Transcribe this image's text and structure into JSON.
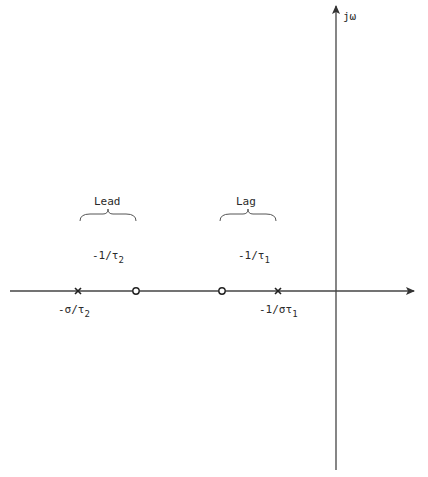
{
  "diagram": {
    "type": "s-plane pole-zero plot",
    "axes": {
      "imag_label": "jω",
      "real_axis": {
        "x1": 10,
        "x2": 415,
        "y": 291
      },
      "imag_axis": {
        "x": 336,
        "y1": 5,
        "y2": 470
      }
    },
    "groups": [
      {
        "label": "Lead",
        "brace_x1": 80,
        "brace_x2": 136,
        "zero_label_main": "-1/τ",
        "zero_label_sub": "2"
      },
      {
        "label": "Lag",
        "brace_x1": 220,
        "brace_x2": 276,
        "zero_label_main": "-1/τ",
        "zero_label_sub": "1"
      }
    ],
    "markers": [
      {
        "kind": "pole",
        "x": 78,
        "label_main": "-σ/τ",
        "label_sub": "2"
      },
      {
        "kind": "zero",
        "x": 136
      },
      {
        "kind": "zero",
        "x": 222
      },
      {
        "kind": "pole",
        "x": 278,
        "label_main": "-1/στ",
        "label_sub": "1"
      }
    ],
    "stroke_color": "#333333"
  }
}
